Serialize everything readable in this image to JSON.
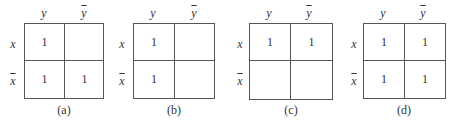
{
  "figure": {
    "col_labels": [
      "y",
      "y"
    ],
    "col_overline": [
      false,
      true
    ],
    "row_labels": [
      "x",
      "x"
    ],
    "row_overline": [
      false,
      true
    ],
    "panels": [
      {
        "caption": "(a)",
        "cells": [
          [
            "1",
            ""
          ],
          [
            "1",
            "1"
          ]
        ]
      },
      {
        "caption": "(b)",
        "cells": [
          [
            "1",
            ""
          ],
          [
            "1",
            ""
          ]
        ]
      },
      {
        "caption": "(c)",
        "cells": [
          [
            "1",
            "1"
          ],
          [
            "",
            ""
          ]
        ]
      },
      {
        "caption": "(d)",
        "cells": [
          [
            "1",
            "1"
          ],
          [
            "1",
            "1"
          ]
        ]
      }
    ]
  }
}
